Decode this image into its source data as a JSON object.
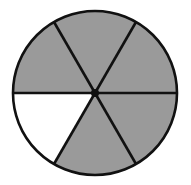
{
  "diagram": {
    "type": "fraction-circle",
    "description": "Circle divided into 6 equal sectors, 5 shaded",
    "total_parts": 6,
    "shaded_parts": 5,
    "fraction_shaded": "5/6",
    "center": [
      95,
      93
    ],
    "radius": 82,
    "colors": {
      "shaded": "#9a9a9a",
      "unshaded": "#ffffff",
      "stroke": "#111111",
      "center_dot": "#111111"
    },
    "sectors": [
      {
        "index": 0,
        "start_deg": 0,
        "end_deg": 60,
        "shaded": true,
        "position": "upper-right"
      },
      {
        "index": 1,
        "start_deg": 60,
        "end_deg": 120,
        "shaded": true,
        "position": "top"
      },
      {
        "index": 2,
        "start_deg": 120,
        "end_deg": 180,
        "shaded": true,
        "position": "upper-left"
      },
      {
        "index": 3,
        "start_deg": 180,
        "end_deg": 240,
        "shaded": false,
        "position": "lower-left"
      },
      {
        "index": 4,
        "start_deg": 240,
        "end_deg": 300,
        "shaded": true,
        "position": "bottom"
      },
      {
        "index": 5,
        "start_deg": 300,
        "end_deg": 360,
        "shaded": true,
        "position": "lower-right"
      }
    ]
  }
}
